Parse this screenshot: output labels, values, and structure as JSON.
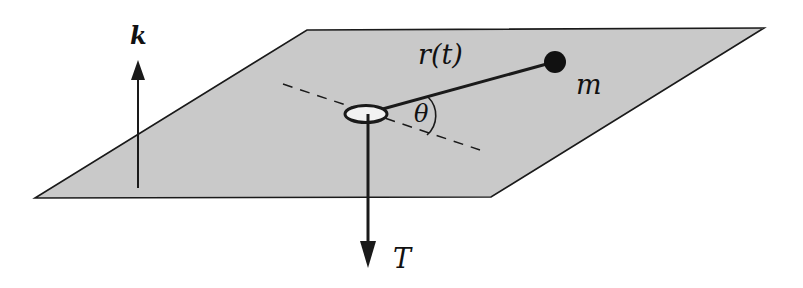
{
  "figure": {
    "labels": {
      "k_vector": "k",
      "radius": "r(t)",
      "mass": "m",
      "angle": "θ",
      "tension": "T"
    },
    "colors": {
      "plane_fill": "#c9c9c9",
      "stroke": "#1a1a1a",
      "hole_fill": "#f2f2f2",
      "background": "#ffffff"
    }
  }
}
